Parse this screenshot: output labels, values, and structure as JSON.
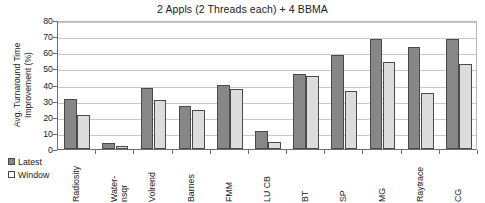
{
  "chart_data": {
    "type": "bar",
    "title": "2 Appls (2 Threads each) + 4 BBMA",
    "xlabel": "",
    "ylabel": "Avg. Turnaround Time Improvement (%)",
    "ylabel_line1": "Avg. Turnaround Time",
    "ylabel_line2": "Improvement (%)",
    "ylim": [
      0,
      80
    ],
    "ytick_step": 10,
    "yticks": [
      "80",
      "70",
      "60",
      "50",
      "40",
      "30",
      "20",
      "10",
      "0"
    ],
    "grid": true,
    "legend_position": "bottom-left",
    "categories": [
      "Radiosity",
      "Water-nsqr",
      "Volrend",
      "Barnes",
      "FMM",
      "LU CB",
      "BT",
      "SP",
      "MG",
      "Raytrace",
      "CG"
    ],
    "category_lines": [
      [
        "Radiosity"
      ],
      [
        "Water-",
        "nsqr"
      ],
      [
        "Volrend"
      ],
      [
        "Barnes"
      ],
      [
        "FMM"
      ],
      [
        "LU CB"
      ],
      [
        "BT"
      ],
      [
        "SP"
      ],
      [
        "MG"
      ],
      [
        "Raytrace"
      ],
      [
        "CG"
      ]
    ],
    "series": [
      {
        "name": "Latest",
        "color": "#878787",
        "values": [
          31,
          4,
          38,
          26.5,
          39.5,
          11,
          46.5,
          58.5,
          68,
          63,
          68
        ]
      },
      {
        "name": "Window",
        "color": "#dcdcdc",
        "values": [
          21,
          2,
          30.5,
          24,
          37.5,
          4.5,
          45,
          36,
          54,
          35,
          52.5
        ]
      }
    ]
  },
  "colors": {
    "latest": "#878787",
    "window": "#dcdcdc",
    "bar_border": "#4a4a4a",
    "axis": "#6e6e6e",
    "grid": "#c9c9c9",
    "background": "#ffffff",
    "text": "#1a1a1a"
  }
}
